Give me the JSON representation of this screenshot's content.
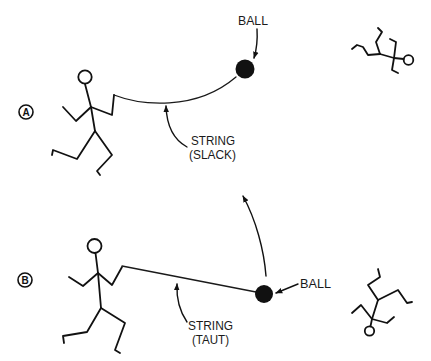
{
  "diagram": {
    "colors": {
      "ink": "#111111",
      "background": "#ffffff"
    },
    "panels": [
      {
        "badge": "A",
        "ball_label": "BALL",
        "string_label_line1": "STRING",
        "string_label_line2": "(SLACK)",
        "string_state": "slack"
      },
      {
        "badge": "B",
        "ball_label": "BALL",
        "string_label_line1": "STRING",
        "string_label_line2": "(TAUT)",
        "string_state": "taut"
      }
    ]
  }
}
